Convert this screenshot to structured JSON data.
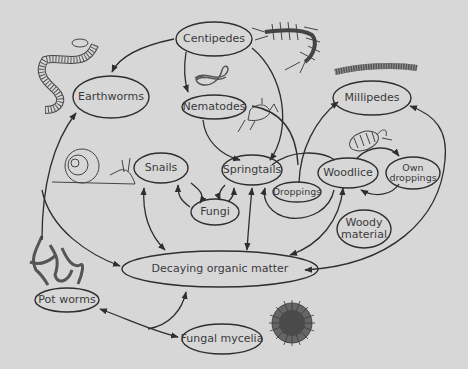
{
  "diagram": {
    "type": "soil food web",
    "background_color": "#d7d7d7",
    "line_color": "#2e2e2e",
    "text_color": "#3a3a3a",
    "nodes": {
      "centipedes": {
        "label": "Centipedes"
      },
      "earthworms": {
        "label": "Earthworms"
      },
      "nematodes": {
        "label": "Nematodes"
      },
      "millipedes": {
        "label": "Millipedes"
      },
      "snails": {
        "label": "Snails"
      },
      "springtails": {
        "label": "Springtails"
      },
      "woodlice": {
        "label": "Woodlice"
      },
      "own_droppings": {
        "label_line1": "Own",
        "label_line2": "droppings"
      },
      "droppings": {
        "label": "Droppings"
      },
      "fungi": {
        "label": "Fungi"
      },
      "woody_material": {
        "label_line1": "Woody",
        "label_line2": "material"
      },
      "decaying_organic_matter": {
        "label": "Decaying organic matter"
      },
      "pot_worms": {
        "label": "Pot worms"
      },
      "fungal_mycelia": {
        "label": "Fungal mycelia"
      }
    },
    "illustrations": [
      "centipede-illustration",
      "earthworm-illustration",
      "nematode-illustration",
      "millipede-illustration",
      "snail-illustration",
      "springtail-illustration",
      "woodlouse-illustration",
      "pot-worms-illustration",
      "fungal-mycelia-illustration"
    ],
    "edges": [
      {
        "from": "Centipedes",
        "to": "Earthworms"
      },
      {
        "from": "Centipedes",
        "to": "Nematodes"
      },
      {
        "from": "Centipedes",
        "to": "Springtails"
      },
      {
        "from": "Nematodes",
        "to": "Springtails"
      },
      {
        "from": "Nematodes",
        "to": "Droppings"
      },
      {
        "from": "Decaying organic matter",
        "to": "Earthworms"
      },
      {
        "from": "Earthworms",
        "to": "Decaying organic matter"
      },
      {
        "from": "Snails",
        "to": "Fungi",
        "bidirectional": true
      },
      {
        "from": "Snails",
        "to": "Decaying organic matter",
        "bidirectional": true
      },
      {
        "from": "Fungi",
        "to": "Springtails",
        "bidirectional": true
      },
      {
        "from": "Springtails",
        "to": "Decaying organic matter",
        "bidirectional": true
      },
      {
        "from": "Springtails",
        "to": "Woodlice"
      },
      {
        "from": "Woodlice",
        "to": "Springtails"
      },
      {
        "from": "Droppings",
        "to": "Millipedes"
      },
      {
        "from": "Woodlice",
        "to": "Own droppings"
      },
      {
        "from": "Own droppings",
        "to": "Woodlice"
      },
      {
        "from": "Woodlice",
        "to": "Decaying organic matter",
        "bidirectional": true
      },
      {
        "from": "Decaying organic matter",
        "to": "Millipedes",
        "bidirectional": true
      },
      {
        "from": "Pot worms",
        "to": "Fungal mycelia",
        "bidirectional": true
      },
      {
        "from": "Pot worms",
        "to": "Decaying organic matter"
      }
    ]
  }
}
